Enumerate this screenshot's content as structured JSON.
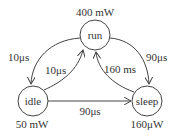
{
  "diagram": {
    "type": "state-machine",
    "states": [
      {
        "id": "run",
        "label": "run",
        "power": "400 mW"
      },
      {
        "id": "idle",
        "label": "idle",
        "power": "50 mW"
      },
      {
        "id": "sleep",
        "label": "sleep",
        "power": "160μW"
      }
    ],
    "transitions": [
      {
        "from": "run",
        "to": "idle",
        "label": "10μs"
      },
      {
        "from": "idle",
        "to": "run",
        "label": "10μs"
      },
      {
        "from": "run",
        "to": "sleep",
        "label": "90μs"
      },
      {
        "from": "sleep",
        "to": "run",
        "label": "160 ms"
      },
      {
        "from": "idle",
        "to": "sleep",
        "label": "90μs"
      }
    ]
  },
  "colors": {
    "stroke": "#444444",
    "background": "#ffffff"
  }
}
